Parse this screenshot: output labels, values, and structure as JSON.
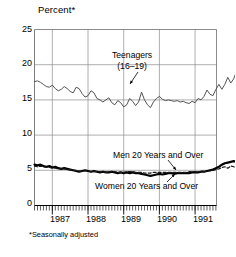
{
  "chart_data": {
    "type": "line",
    "title": "Percent*",
    "xlabel": "",
    "ylabel": "Percent",
    "footnote": "*Seasonally adjusted",
    "grid": true,
    "legend_position": "inline-annotations",
    "ylim": [
      0,
      25
    ],
    "yticks": [
      0,
      5,
      10,
      15,
      20,
      25
    ],
    "ytick_labels": [
      "0",
      "5",
      "10",
      "15",
      "20",
      "25"
    ],
    "xlim": [
      1986.5,
      1991.6
    ],
    "xticks": [
      1987,
      1988,
      1989,
      1990,
      1991
    ],
    "xtick_labels": [
      "1987",
      "1988",
      "1989",
      "1990",
      "1991"
    ],
    "x_minor_tick_interval_months": 1,
    "x_values_note": "Monthly, mid-1986 through mid-1991",
    "series": [
      {
        "name": "Teenagers (16–19)",
        "style": "thin-solid",
        "values": [
          17.6,
          17.7,
          17.5,
          17.2,
          16.9,
          16.8,
          17.1,
          16.6,
          16.3,
          16.5,
          16.9,
          16.6,
          16.2,
          16.0,
          16.8,
          16.6,
          15.9,
          15.4,
          15.6,
          16.3,
          16.0,
          15.2,
          15.0,
          14.7,
          15.0,
          15.3,
          14.6,
          14.3,
          14.9,
          14.6,
          14.0,
          14.3,
          15.2,
          14.8,
          14.2,
          14.7,
          16.1,
          15.0,
          14.3,
          13.9,
          14.7,
          15.2,
          15.5,
          15.1,
          14.9,
          15.0,
          14.9,
          14.8,
          14.9,
          14.7,
          14.8,
          14.6,
          14.5,
          14.8,
          14.6,
          15.2,
          15.0,
          15.5,
          16.4,
          15.8,
          15.6,
          16.5,
          17.2,
          16.5,
          17.2,
          18.2,
          17.4,
          18.0,
          19.2,
          18.8,
          19.4,
          20.6,
          19.8,
          19.0,
          18.3,
          17.5
        ]
      },
      {
        "name": "Men 20 Years and Over",
        "style": "thick-solid",
        "values": [
          5.8,
          5.7,
          5.8,
          5.6,
          5.5,
          5.6,
          5.4,
          5.5,
          5.3,
          5.2,
          5.3,
          5.2,
          5.1,
          5.0,
          4.9,
          4.8,
          4.9,
          5.0,
          4.9,
          4.8,
          4.9,
          4.8,
          4.7,
          4.8,
          4.7,
          4.7,
          4.8,
          4.7,
          4.6,
          4.7,
          4.6,
          4.7,
          4.6,
          4.7,
          4.6,
          4.6,
          4.5,
          4.4,
          4.3,
          4.2,
          4.3,
          4.4,
          4.5,
          4.4,
          4.5,
          4.6,
          4.6,
          4.5,
          4.6,
          4.6,
          4.6,
          4.6,
          4.6,
          4.7,
          4.7,
          4.7,
          4.8,
          4.8,
          4.9,
          5.0,
          5.1,
          5.3,
          5.5,
          5.8,
          6.0,
          6.1,
          6.2,
          6.3,
          6.2,
          6.2,
          6.3,
          6.4,
          6.3,
          6.3,
          6.4,
          6.4
        ]
      },
      {
        "name": "Women 20 Years and Over",
        "style": "dashed",
        "values": [
          5.6,
          5.5,
          5.6,
          5.5,
          5.4,
          5.4,
          5.3,
          5.3,
          5.2,
          5.2,
          5.2,
          5.1,
          5.1,
          5.0,
          5.0,
          4.9,
          4.9,
          4.9,
          4.9,
          4.8,
          4.8,
          4.8,
          4.8,
          4.8,
          4.7,
          4.8,
          4.8,
          4.8,
          4.7,
          4.7,
          4.7,
          4.8,
          4.8,
          4.8,
          4.7,
          4.7,
          4.7,
          4.6,
          4.6,
          4.6,
          4.7,
          4.7,
          4.7,
          4.7,
          4.7,
          4.7,
          4.7,
          4.7,
          4.7,
          4.7,
          4.7,
          4.7,
          4.8,
          4.8,
          4.8,
          4.8,
          4.8,
          4.8,
          4.9,
          4.9,
          5.0,
          5.1,
          5.2,
          5.4,
          5.5,
          5.3,
          5.6,
          5.5,
          5.3,
          5.6,
          5.5,
          5.2,
          5.5,
          5.4,
          5.2,
          5.3
        ]
      }
    ],
    "annotations": [
      {
        "text_line1": "Teenagers",
        "text_line2": "(16–19)",
        "target": "teenagers-series"
      },
      {
        "text_line1": "Men 20 Years and Over",
        "text_line2": "",
        "target": "men-series"
      },
      {
        "text_line1": "Women 20 Years and Over",
        "text_line2": "",
        "target": "women-series"
      }
    ],
    "colors": {
      "teenagers": "#4a4a4a",
      "men": "#000000",
      "women": "#1a1a1a",
      "grid": "#8c8c8c",
      "axis": "#6e6e6e",
      "background": "#ffffff"
    }
  }
}
